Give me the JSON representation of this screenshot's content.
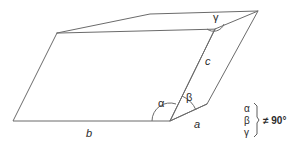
{
  "figure": {
    "edge_labels": {
      "a": "a",
      "b": "b",
      "c": "c"
    },
    "angle_labels": {
      "alpha": "α",
      "beta": "β",
      "gamma": "γ"
    },
    "legend": {
      "symbols": [
        "α",
        "β",
        "γ"
      ],
      "alpha": "α",
      "beta": "β",
      "gamma": "γ",
      "relation": "≠ 90°"
    },
    "colors": {
      "line": "#6b6b6b",
      "text": "#2b2b2b",
      "background": "#ffffff"
    }
  }
}
